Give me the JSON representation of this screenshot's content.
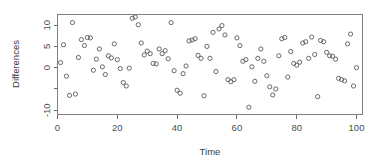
{
  "chart_data": {
    "type": "scatter",
    "title": "",
    "xlabel": "Time",
    "ylabel": "Differences",
    "xlim": [
      0,
      102
    ],
    "ylim": [
      -11,
      12.5
    ],
    "xticks": [
      0,
      20,
      40,
      60,
      80,
      100
    ],
    "xtick_labels": [
      "0",
      "20",
      "40",
      "60",
      "80",
      "100"
    ],
    "yticks": [
      10,
      5,
      0,
      -5,
      -10
    ],
    "ytick_labels": [
      "10",
      "5",
      "0",
      "",
      "-10"
    ],
    "grid": false,
    "legend": null,
    "marker": "open-circle",
    "marker_color": "#595959",
    "n_points": 100,
    "x": [
      1,
      2,
      3,
      4,
      5,
      6,
      7,
      8,
      9,
      10,
      11,
      12,
      13,
      14,
      15,
      16,
      17,
      18,
      19,
      20,
      21,
      22,
      23,
      24,
      25,
      26,
      27,
      28,
      29,
      30,
      31,
      32,
      33,
      34,
      35,
      36,
      37,
      38,
      39,
      40,
      41,
      42,
      43,
      44,
      45,
      46,
      47,
      48,
      49,
      50,
      51,
      52,
      53,
      54,
      55,
      56,
      57,
      58,
      59,
      60,
      61,
      62,
      63,
      64,
      65,
      66,
      67,
      68,
      69,
      70,
      71,
      72,
      73,
      74,
      75,
      76,
      77,
      78,
      79,
      80,
      81,
      82,
      83,
      84,
      85,
      86,
      87,
      88,
      89,
      90,
      91,
      92,
      93,
      94,
      95,
      96,
      97,
      98,
      99,
      100
    ],
    "y": [
      1.2,
      5.4,
      -2.0,
      -6.5,
      10.6,
      -6.2,
      2.4,
      6.6,
      5.2,
      7.1,
      7.0,
      -0.6,
      2.0,
      4.4,
      0.2,
      -1.6,
      2.8,
      2.3,
      5.6,
      1.9,
      -0.2,
      -3.5,
      -4.3,
      -0.1,
      11.6,
      11.9,
      10.1,
      5.8,
      3.0,
      3.9,
      3.3,
      1.0,
      0.9,
      4.4,
      3.3,
      4.0,
      2.1,
      10.6,
      -0.7,
      -5.3,
      -6.0,
      -1.4,
      0.4,
      6.3,
      6.5,
      6.8,
      2.9,
      2.2,
      -6.6,
      5.0,
      2.2,
      8.3,
      -0.9,
      9.1,
      9.9,
      7.7,
      -2.8,
      -3.3,
      -2.8,
      7.0,
      5.2,
      1.5,
      1.9,
      -9.3,
      0.2,
      -3.2,
      2.2,
      4.4,
      1.5,
      -1.9,
      -4.5,
      -6.4,
      -5.0,
      2.8,
      6.8,
      7.1,
      -2.2,
      3.8,
      1.0,
      0.6,
      1.3,
      5.8,
      6.1,
      2.2,
      7.2,
      3.1,
      -6.8,
      6.4,
      6.1,
      3.6,
      2.8,
      2.7,
      2.0,
      -2.5,
      -2.8,
      -3.1,
      5.6,
      7.9,
      -4.3,
      0.0
    ]
  },
  "axes": {
    "ylabel": "Differences",
    "xlabel": "Time"
  }
}
